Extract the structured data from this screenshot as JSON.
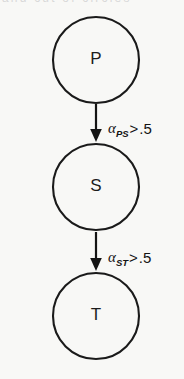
{
  "figure": {
    "type": "path-diagram",
    "top_cropped_text": "and  cut  of  circles",
    "background_color": "#f8f8f6",
    "stroke_color": "#141414"
  },
  "nodes": [
    {
      "id": "P",
      "label": "P",
      "cx": 96,
      "cy": 60,
      "r": 43
    },
    {
      "id": "S",
      "label": "S",
      "cx": 96,
      "cy": 187,
      "r": 43
    },
    {
      "id": "T",
      "label": "T",
      "cx": 96,
      "cy": 316,
      "r": 43
    }
  ],
  "edges": [
    {
      "id": "P-S",
      "from": "P",
      "to": "S",
      "x": 96,
      "y_start": 104,
      "y_end": 141,
      "label": {
        "symbol": "α",
        "subscript": "PS",
        "relation": ">",
        "value": ".5",
        "full": "αPS > .5",
        "x": 108,
        "y": 130
      }
    },
    {
      "id": "S-T",
      "from": "S",
      "to": "T",
      "x": 96,
      "y_start": 232,
      "y_end": 270,
      "label": {
        "symbol": "α",
        "subscript": "ST",
        "relation": ">",
        "value": ".5",
        "full": "αST > .5",
        "x": 108,
        "y": 259
      }
    }
  ]
}
